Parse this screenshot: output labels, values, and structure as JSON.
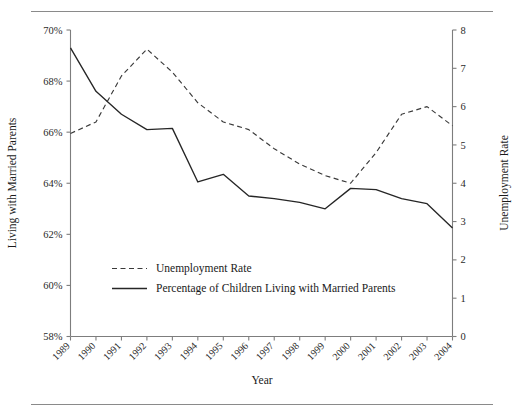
{
  "chart_data": {
    "type": "line",
    "title": "",
    "xlabel": "Year",
    "ylabel_left": "Living with Married Parents",
    "ylabel_right": "Unemployment Rate",
    "categories": [
      "1989",
      "1990",
      "1991",
      "1992",
      "1993",
      "1994",
      "1995",
      "1996",
      "1997",
      "1998",
      "1999",
      "2000",
      "2001",
      "2002",
      "2003",
      "2004"
    ],
    "left_axis": {
      "ticks": [
        "58%",
        "60%",
        "62%",
        "64%",
        "66%",
        "68%",
        "70%"
      ],
      "tick_values": [
        58,
        60,
        62,
        64,
        66,
        68,
        70
      ],
      "ylim": [
        58,
        70
      ]
    },
    "right_axis": {
      "ticks": [
        "0",
        "1",
        "2",
        "3",
        "4",
        "5",
        "6",
        "7",
        "8"
      ],
      "tick_values": [
        0,
        1,
        2,
        3,
        4,
        5,
        6,
        7,
        8
      ],
      "ylim": [
        0,
        8
      ]
    },
    "grid": false,
    "legend_position": "lower-left-inside",
    "series": [
      {
        "name": "Unemployment Rate",
        "axis": "right",
        "style": "dashed",
        "values": [
          5.3,
          5.6,
          6.8,
          7.5,
          6.9,
          6.1,
          5.6,
          5.4,
          4.9,
          4.5,
          4.2,
          4.0,
          4.8,
          5.8,
          6.0,
          5.5
        ]
      },
      {
        "name": "Percentage of Children Living with Married Parents",
        "axis": "left",
        "style": "solid",
        "values": [
          69.3,
          67.6,
          66.7,
          66.1,
          66.15,
          64.05,
          64.35,
          63.5,
          63.4,
          63.25,
          63.0,
          63.8,
          63.75,
          63.4,
          63.2,
          62.25
        ]
      }
    ]
  },
  "legend": {
    "entries": [
      {
        "label": "Unemployment Rate",
        "style": "dashed"
      },
      {
        "label": "Percentage of Children Living with Married Parents",
        "style": "solid"
      }
    ]
  }
}
